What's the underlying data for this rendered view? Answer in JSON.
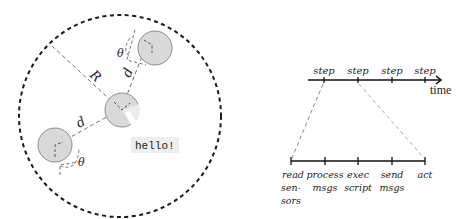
{
  "swarm_diagram": {
    "labels": {
      "radius": "R",
      "distance_top": "d",
      "distance_left": "d",
      "angle_top": "θ",
      "angle_left": "θ"
    },
    "message_bubble": "hello!",
    "colors": {
      "agent_fill": "#d9d9d9",
      "agent_stroke": "#8c8c8c",
      "boundary_stroke": "#1a1a1a",
      "guide_stroke": "#6e6e6e",
      "bubble_fill": "#eeeeee"
    }
  },
  "timeline": {
    "steps": [
      "step",
      "step",
      "step",
      "step"
    ],
    "axis_label": "time",
    "phases": [
      {
        "line1": "read",
        "line2": "sen-",
        "line3": "sors"
      },
      {
        "line1": "process",
        "line2": "msgs"
      },
      {
        "line1": "exec",
        "line2": "script"
      },
      {
        "line1": "send",
        "line2": "msgs"
      },
      {
        "line1": "act"
      }
    ]
  }
}
